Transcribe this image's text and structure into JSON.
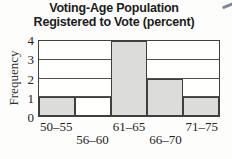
{
  "title": {
    "line1": "Voting-Age Population",
    "line2": "Registered to Vote (percent)"
  },
  "chart_data": {
    "type": "bar",
    "subtype": "histogram",
    "title": "Voting-Age Population Registered to Vote (percent)",
    "ylabel": "Frequency",
    "xlabel": "",
    "categories": [
      "50–55",
      "56–60",
      "61–65",
      "66–70",
      "71–75"
    ],
    "values": [
      1,
      1,
      4,
      2,
      1
    ],
    "ylim": [
      0,
      4
    ],
    "yticks": [
      0,
      1,
      2,
      3,
      4
    ],
    "grid": "horizontal gridlines at 1, 2, 3 behind bars",
    "legend": "none",
    "label_rows": [
      1,
      2,
      1,
      2,
      1
    ],
    "bar_fills": [
      "#dcdcda",
      "#fffffe",
      "#dcdcda",
      "#dcdcda",
      "#dcdcda"
    ],
    "colors": {
      "bar_fill": "#dcdcda",
      "bar_outline": "#3f3f3f",
      "gridline": "#4e4e4e",
      "title_text": "#1c1c1c",
      "axis_text": "#242424",
      "background": "#fdfdfc"
    }
  }
}
